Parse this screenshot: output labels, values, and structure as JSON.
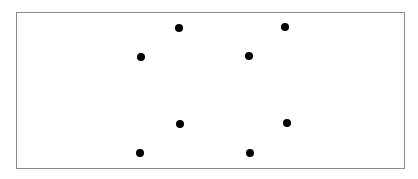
{
  "diagram": {
    "frame": {
      "border_color": "#8c8c8c",
      "background": "#ffffff"
    },
    "dot_color": "#000000",
    "dot_diameter": 8,
    "dots": [
      {
        "id": "dot-1",
        "x": 179,
        "y": 28
      },
      {
        "id": "dot-2",
        "x": 285,
        "y": 27
      },
      {
        "id": "dot-3",
        "x": 141,
        "y": 57
      },
      {
        "id": "dot-4",
        "x": 249,
        "y": 56
      },
      {
        "id": "dot-5",
        "x": 180,
        "y": 124
      },
      {
        "id": "dot-6",
        "x": 287,
        "y": 123
      },
      {
        "id": "dot-7",
        "x": 140,
        "y": 153
      },
      {
        "id": "dot-8",
        "x": 250,
        "y": 153
      }
    ]
  }
}
